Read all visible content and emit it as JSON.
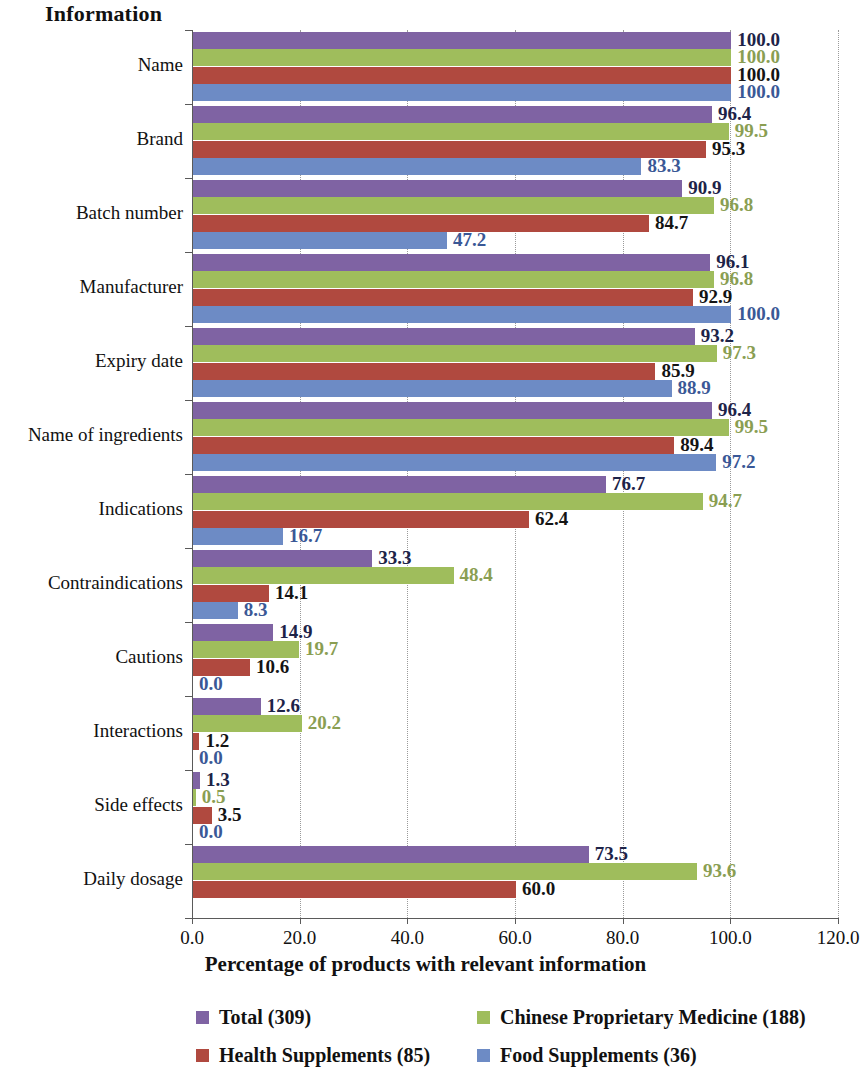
{
  "title": "Information",
  "xaxis_title": "Percentage of products with relevant information",
  "colors": {
    "total": "#7f63a3",
    "cpm": "#9fbd5c",
    "health": "#b0493f",
    "food": "#6d8bc5"
  },
  "legend": {
    "items": [
      {
        "label": "Total (309)",
        "color": "#7f63a3",
        "swatch": "sw0"
      },
      {
        "label": "Chinese Proprietary Medicine (188)",
        "color": "#9fbd5c",
        "swatch": "sw1"
      },
      {
        "label": "Health Supplements (85)",
        "color": "#b0493f",
        "swatch": "sw2"
      },
      {
        "label": "Food Supplements (36)",
        "color": "#6d8bc5",
        "swatch": "sw3"
      }
    ]
  },
  "chart_data": {
    "type": "bar",
    "orientation": "horizontal",
    "title": "Information",
    "xlabel": "Percentage of products with relevant information",
    "ylabel": "Information",
    "xlim": [
      0,
      120
    ],
    "xticks": [
      "0.0",
      "20.0",
      "40.0",
      "60.0",
      "80.0",
      "100.0",
      "120.0"
    ],
    "xtick_values": [
      0,
      20,
      40,
      60,
      80,
      100,
      120
    ],
    "grid": "vertical-dotted",
    "legend_position": "bottom",
    "categories": [
      "Name",
      "Brand",
      "Batch number",
      "Manufacturer",
      "Expiry date",
      "Name of ingredients",
      "Indications",
      "Contraindications",
      "Cautions",
      "Interactions",
      "Side effects",
      "Daily dosage"
    ],
    "series": [
      {
        "name": "Total (309)",
        "color": "#7f63a3",
        "values": [
          100.0,
          96.4,
          90.9,
          96.1,
          93.2,
          96.4,
          76.7,
          33.3,
          14.9,
          12.6,
          1.3,
          73.5
        ],
        "labels": [
          "100.0",
          "96.4",
          "90.9",
          "96.1",
          "93.2",
          "96.4",
          "76.7",
          "33.3",
          "14.9",
          "12.6",
          "1.3",
          "73.5"
        ]
      },
      {
        "name": "Chinese Proprietary Medicine (188)",
        "color": "#9fbd5c",
        "values": [
          100.0,
          99.5,
          96.8,
          96.8,
          97.3,
          99.5,
          94.7,
          48.4,
          19.7,
          20.2,
          0.5,
          93.6
        ],
        "labels": [
          "100.0",
          "99.5",
          "96.8",
          "96.8",
          "97.3",
          "99.5",
          "94.7",
          "48.4",
          "19.7",
          "20.2",
          "0.5",
          "93.6"
        ]
      },
      {
        "name": "Health Supplements (85)",
        "color": "#b0493f",
        "values": [
          100.0,
          95.3,
          84.7,
          92.9,
          85.9,
          89.4,
          62.4,
          14.1,
          10.6,
          1.2,
          3.5,
          60.0
        ],
        "labels": [
          "100.0",
          "95.3",
          "84.7",
          "92.9",
          "85.9",
          "89.4",
          "62.4",
          "14.1",
          "10.6",
          "1.2",
          "3.5",
          "60.0"
        ]
      },
      {
        "name": "Food Supplements (36)",
        "color": "#6d8bc5",
        "values": [
          100.0,
          83.3,
          47.2,
          100.0,
          88.9,
          97.2,
          16.7,
          8.3,
          0.0,
          0.0,
          0.0,
          null
        ],
        "labels": [
          "100.0",
          "83.3",
          "47.2",
          "100.0",
          "88.9",
          "97.2",
          "16.7",
          "8.3",
          "0.0",
          "0.0",
          "0.0",
          null
        ]
      }
    ]
  }
}
